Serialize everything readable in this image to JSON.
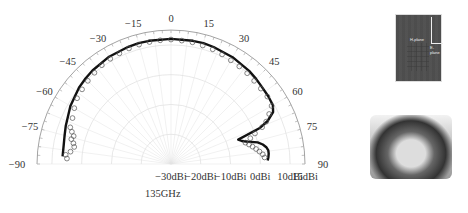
{
  "figure": {
    "frequency_label": "135GHz",
    "photo_top": {
      "labels": [
        "H-plane",
        "E-plane"
      ]
    },
    "photo_bottom": {
      "description": "measurement setup photo"
    }
  },
  "chart_data": {
    "type": "polar",
    "title": "135GHz",
    "angle_unit": "degrees",
    "angle_range": [
      -90,
      90
    ],
    "angle_ticks": [
      -90,
      -75,
      -60,
      -45,
      -30,
      -15,
      0,
      15,
      30,
      45,
      60,
      75,
      90
    ],
    "radial_unit": "dBi",
    "radial_range": [
      -30,
      15
    ],
    "radial_ticks": [
      -30,
      -20,
      -10,
      0,
      10,
      15
    ],
    "radial_tick_labels": [
      "-30dBi",
      "-20dBi",
      "-10dBi",
      "0dBi",
      "10dBi",
      "15dBi"
    ],
    "grid": true,
    "series": [
      {
        "name": "Simulated",
        "style": "solid-line",
        "angles": [
          -86,
          -80,
          -75,
          -70,
          -60,
          -50,
          -45,
          -40,
          -30,
          -20,
          -15,
          -10,
          0,
          10,
          15,
          20,
          30,
          40,
          45,
          50,
          55,
          60,
          63,
          66,
          68,
          70,
          72,
          74,
          76,
          78,
          80,
          82,
          84,
          86,
          88
        ],
        "values": [
          6.5,
          6.6,
          7,
          7.6,
          9,
          10.2,
          10.6,
          11,
          11.6,
          11.9,
          12,
          12,
          12,
          12,
          12,
          11.8,
          11.4,
          10.8,
          10.4,
          10,
          9.8,
          9.5,
          8.5,
          5.5,
          2,
          -6,
          -5,
          -3,
          0,
          1.5,
          2.5,
          3,
          3,
          2.8,
          2.5
        ]
      },
      {
        "name": "Measured",
        "style": "open-circles",
        "angles": [
          -87,
          -85,
          -83,
          -80,
          -78,
          -76,
          -74,
          -72,
          -70,
          -65,
          -60,
          -55,
          -50,
          -45,
          -40,
          -35,
          -30,
          -25,
          -20,
          -15,
          -10,
          -5,
          0,
          5,
          10,
          15,
          20,
          25,
          30,
          35,
          40,
          45,
          50,
          55,
          60,
          63,
          66,
          68,
          70,
          72,
          74,
          76,
          78,
          80,
          82,
          84,
          86
        ],
        "values": [
          5,
          5.5,
          4,
          3,
          3.5,
          4.5,
          4,
          5,
          6,
          6.5,
          7.5,
          8.5,
          9,
          9.5,
          10,
          10.5,
          10.8,
          11,
          11.3,
          11.5,
          11.6,
          11.7,
          11.8,
          11.6,
          11.5,
          11.2,
          11,
          10.6,
          10.2,
          10,
          9.8,
          9.5,
          9.4,
          9.5,
          9,
          7,
          5,
          3,
          0,
          -2,
          -4,
          -3,
          -2,
          -1,
          0,
          1,
          1.5
        ]
      }
    ]
  }
}
